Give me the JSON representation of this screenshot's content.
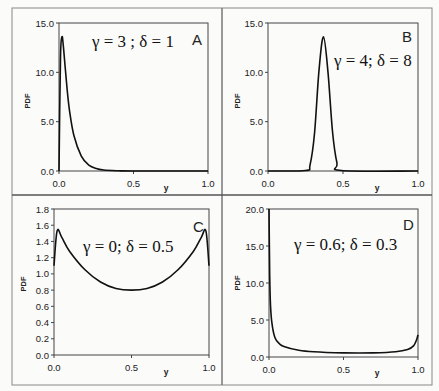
{
  "figure": {
    "panels": [
      {
        "id": "A",
        "letter": "A",
        "annotation": "γ = 3 ;  δ = 1",
        "ylabel": "PDF",
        "xlabel": "y",
        "yticks": [
          "0.0",
          "5.0",
          "10.0",
          "15.0"
        ],
        "xticks": [
          "0.0",
          "0.5",
          "1.0"
        ]
      },
      {
        "id": "B",
        "letter": "B",
        "annotation": "γ = 4;  δ = 8",
        "ylabel": "PDF",
        "xlabel": "y",
        "yticks": [
          "0.0",
          "5.0",
          "10.0",
          "15.0"
        ],
        "xticks": [
          "0.0",
          "0.5",
          "1.0"
        ]
      },
      {
        "id": "C",
        "letter": "C",
        "annotation": "γ = 0;  δ = 0.5",
        "ylabel": "PDF",
        "xlabel": "y",
        "yticks": [
          "0.0",
          "0.2",
          "0.4",
          "0.6",
          "0.8",
          "1.0",
          "1.2",
          "1.4",
          "1.6",
          "1.8"
        ],
        "xticks": [
          "0.0",
          "0.5",
          "1.0"
        ]
      },
      {
        "id": "D",
        "letter": "D",
        "annotation": "γ = 0.6;  δ = 0.3",
        "ylabel": "PDF",
        "xlabel": "y",
        "yticks": [
          "0.0",
          "5.0",
          "10.0",
          "15.0",
          "20.0"
        ],
        "xticks": [
          "0.0",
          "0.5",
          "1.0"
        ]
      }
    ]
  },
  "chart_data": [
    {
      "type": "line",
      "panel": "A",
      "title": "γ = 3 ; δ = 1",
      "xlabel": "y",
      "ylabel": "PDF",
      "xlim": [
        0,
        1
      ],
      "ylim": [
        0,
        15
      ],
      "grid": false,
      "x": [
        0.0,
        0.01,
        0.02,
        0.03,
        0.05,
        0.07,
        0.1,
        0.15,
        0.2,
        0.25,
        0.3,
        0.4,
        0.5,
        1.0
      ],
      "values": [
        0.0,
        11.5,
        13.6,
        12.5,
        9.0,
        6.2,
        3.6,
        1.5,
        0.6,
        0.25,
        0.1,
        0.02,
        0.0,
        0.0
      ]
    },
    {
      "type": "line",
      "panel": "B",
      "title": "γ = 4; δ = 8",
      "xlabel": "y",
      "ylabel": "PDF",
      "xlim": [
        0,
        1
      ],
      "ylim": [
        0,
        15
      ],
      "grid": false,
      "x": [
        0.0,
        0.25,
        0.28,
        0.31,
        0.34,
        0.37,
        0.4,
        0.43,
        0.46,
        0.49,
        1.0
      ],
      "values": [
        0.0,
        0.05,
        0.6,
        3.8,
        10.2,
        13.6,
        10.0,
        4.0,
        0.8,
        0.05,
        0.0
      ]
    },
    {
      "type": "line",
      "panel": "C",
      "title": "γ = 0; δ = 0.5",
      "xlabel": "y",
      "ylabel": "PDF",
      "xlim": [
        0,
        1
      ],
      "ylim": [
        0,
        1.8
      ],
      "grid": false,
      "x": [
        0.0,
        0.02,
        0.05,
        0.1,
        0.2,
        0.3,
        0.4,
        0.5,
        0.6,
        0.7,
        0.8,
        0.9,
        0.95,
        0.98,
        1.0
      ],
      "values": [
        1.1,
        1.53,
        1.45,
        1.28,
        1.05,
        0.9,
        0.82,
        0.8,
        0.82,
        0.9,
        1.05,
        1.28,
        1.45,
        1.53,
        1.1
      ]
    },
    {
      "type": "line",
      "panel": "D",
      "title": "γ = 0.6; δ = 0.3",
      "xlabel": "y",
      "ylabel": "PDF",
      "xlim": [
        0,
        1
      ],
      "ylim": [
        0,
        20
      ],
      "grid": false,
      "x": [
        0.0,
        0.005,
        0.01,
        0.02,
        0.04,
        0.07,
        0.1,
        0.2,
        0.3,
        0.5,
        0.7,
        0.85,
        0.93,
        0.97,
        0.99,
        1.0
      ],
      "values": [
        20.0,
        11.0,
        7.0,
        4.5,
        2.6,
        1.8,
        1.4,
        0.9,
        0.7,
        0.55,
        0.55,
        0.7,
        1.0,
        1.5,
        2.3,
        3.0
      ]
    }
  ]
}
